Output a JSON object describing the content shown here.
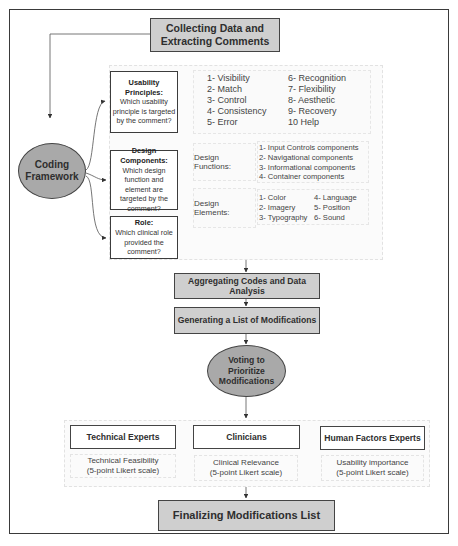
{
  "steps": {
    "collect": "Collecting Data and Extracting Comments",
    "coding": "Coding Framework",
    "aggregate": "Aggregating Codes and Data Analysis",
    "generate": "Generating a List of Modifications",
    "voting": "Voting to Prioritize Modifications",
    "finalize": "Finalizing Modifications List"
  },
  "usability": {
    "title": "Usability Principles:",
    "question": "Which usability principle is targeted by the comment?",
    "principles_col1": [
      "1- Visibility",
      "2- Match",
      "3- Control",
      "4- Consistency",
      "5- Error"
    ],
    "principles_col2": [
      "6- Recognition",
      "7- Flexibility",
      "8- Aesthetic",
      "9- Recovery",
      "10 Help"
    ]
  },
  "design": {
    "title": "Design Components:",
    "question": "Which design function and element are targeted by the comment?",
    "functions_label": "Design Functions:",
    "functions": [
      "1- Input Controls components",
      "2- Navigational components",
      "3- Informational components",
      "4- Container components"
    ],
    "elements_label": "Design Elements:",
    "elements_col1": [
      "1- Color",
      "2- Imagery",
      "3- Typography"
    ],
    "elements_col2": [
      "4- Language",
      "5- Position",
      "6- Sound"
    ]
  },
  "role": {
    "title": "Role:",
    "question": "Which clinical role provided the comment?"
  },
  "voters": [
    {
      "title": "Technical Experts",
      "criterion": "Technical Feasibility",
      "scale": "(5-point Likert scale)"
    },
    {
      "title": "Clinicians",
      "criterion": "Clinical Relevance",
      "scale": "(5-point Likert scale)"
    },
    {
      "title": "Human Factors Experts",
      "criterion": "Usability importance",
      "scale": "(5-point Likert scale)"
    }
  ],
  "colors": {
    "step_fill": "#cfcfcf",
    "ellipse_fill": "#a9a9a9",
    "border": "#444444"
  }
}
